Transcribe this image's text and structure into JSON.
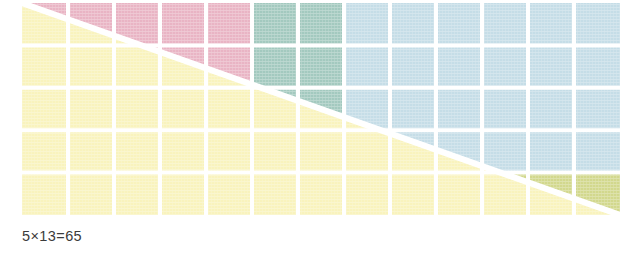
{
  "figure": {
    "caption": "5×13=65",
    "width": 620,
    "height": 258,
    "background": "#ffffff"
  },
  "chart_data": {
    "type": "heatmap",
    "title": "5×13=65",
    "columns": 13,
    "rows": 5,
    "total_cells": 65,
    "xlabel": "",
    "ylabel": "",
    "grid": true,
    "legend": "none",
    "cell_width_px": 46,
    "cell_height_px": 42.4,
    "grid_origin": {
      "x": 22,
      "y": 3
    },
    "partition": {
      "vertical_split_after_column": 5,
      "horizontal_split_after_row": 3,
      "blocks": [
        {
          "name": "top-left",
          "color": "#e9b4c4",
          "columns": 5,
          "rows": 3,
          "cells": 15
        },
        {
          "name": "top-right",
          "color": "#a3c9bf",
          "columns": 8,
          "rows": 3,
          "cells": 24
        },
        {
          "name": "bottom-left",
          "color": "#f9f3bd",
          "columns": 5,
          "rows": 2,
          "cells": 10
        },
        {
          "name": "bottom-right",
          "color": "#c5dde7",
          "columns": 8,
          "rows": 2,
          "cells": 16
        }
      ]
    },
    "regions": [
      {
        "name": "pink-region",
        "color": "#e9b4c4",
        "position": "upper-left",
        "bounded_by": "above-diagonal, left of column 5"
      },
      {
        "name": "green-region",
        "color": "#a3c9bf",
        "position": "upper-right",
        "bounded_by": "above-diagonal, right of column 5"
      },
      {
        "name": "yellow-region",
        "color": "#f9f3bd",
        "position": "lower-left",
        "bounded_by": "below-diagonal, left of column 5"
      },
      {
        "name": "blue-region",
        "color": "#c5dde7",
        "position": "upper-right-lower",
        "bounded_by": "above-diagonal, right of column 5, rows 1-3"
      },
      {
        "name": "olive-region",
        "color": "#d2d88d",
        "position": "lower-right",
        "bounded_by": "below blue, above diagonal, right of column 5"
      }
    ],
    "colors": {
      "pink": "#e9b4c4",
      "green": "#a3c9bf",
      "yellow": "#f9f3bd",
      "blue": "#c5dde7",
      "olive": "#d2d88d",
      "gridline": "#ffffff",
      "diagonal": "#ffffff",
      "caption_text": "#3b3b3b",
      "background": "#ffffff"
    },
    "diagonal": {
      "from": "top-left corner of grid",
      "to": "bottom-right corner of grid",
      "color": "#ffffff",
      "width_px": 5
    }
  }
}
